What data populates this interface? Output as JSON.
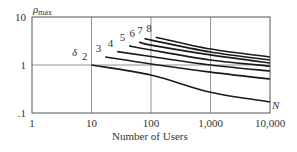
{
  "chart_data": {
    "type": "line",
    "title": "",
    "xlabel": "Number of Users",
    "ylabel": "ρmax",
    "ylabel_main": "ρ",
    "ylabel_sub": "max",
    "x_axis_symbol": "N",
    "series_param_label": "δ",
    "x_scale": "log",
    "y_scale": "log",
    "xlim": [
      1,
      10000
    ],
    "ylim": [
      0.1,
      10
    ],
    "x_ticks": [
      1,
      10,
      100,
      1000,
      10000
    ],
    "x_tick_labels": [
      "1",
      "10",
      "100",
      "1,000",
      "10,000"
    ],
    "y_ticks": [
      0.1,
      1,
      10
    ],
    "y_tick_labels": [
      ".1",
      "1",
      "10"
    ],
    "grid": true,
    "legend": "inline curve labels",
    "series": [
      {
        "name": "2",
        "x": [
          10,
          100,
          1000,
          10000
        ],
        "y": [
          1.0,
          0.62,
          0.27,
          0.17
        ]
      },
      {
        "name": "3",
        "x": [
          17,
          100,
          1000,
          10000
        ],
        "y": [
          1.47,
          1.05,
          0.71,
          0.51
        ]
      },
      {
        "name": "4",
        "x": [
          27,
          100,
          1000,
          10000
        ],
        "y": [
          1.9,
          1.5,
          1.0,
          0.75
        ]
      },
      {
        "name": "5",
        "x": [
          43,
          100,
          1000,
          10000
        ],
        "y": [
          2.5,
          2.05,
          1.27,
          0.95
        ]
      },
      {
        "name": "6",
        "x": [
          63,
          100,
          1000,
          10000
        ],
        "y": [
          3.0,
          2.6,
          1.62,
          1.1
        ]
      },
      {
        "name": "7",
        "x": [
          85,
          100,
          1000,
          10000
        ],
        "y": [
          3.5,
          3.3,
          1.87,
          1.27
        ]
      },
      {
        "name": "8",
        "x": [
          120,
          1000,
          10000
        ],
        "y": [
          3.8,
          2.15,
          1.47
        ]
      }
    ]
  },
  "labels": {
    "y_main": "ρ",
    "y_sub": "max",
    "x_title": "Number of Users",
    "x_symbol": "N",
    "delta": "δ"
  }
}
